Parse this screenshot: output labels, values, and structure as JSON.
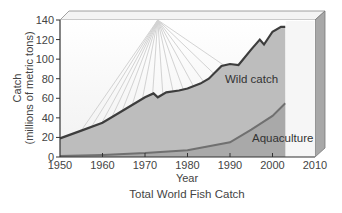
{
  "chart_data": {
    "type": "area",
    "title": "Total World Fish Catch",
    "xlabel": "Year",
    "ylabel": "Catch",
    "ylabel_sub": "(millions of metric tons)",
    "xlim": [
      1950,
      2010
    ],
    "ylim": [
      0,
      140
    ],
    "x_ticks": [
      1950,
      1960,
      1970,
      1980,
      1990,
      2000,
      2010
    ],
    "y_ticks": [
      0,
      20,
      40,
      60,
      80,
      100,
      120,
      140
    ],
    "grid": false,
    "legend": "inline labels",
    "series": [
      {
        "name": "Wild catch",
        "color": "#3d3d3d",
        "fill": "#bdbdbd",
        "x": [
          1950,
          1955,
          1960,
          1965,
          1970,
          1972,
          1973,
          1975,
          1978,
          1980,
          1983,
          1985,
          1988,
          1990,
          1992,
          1995,
          1997,
          1998,
          2000,
          2002,
          2003
        ],
        "values": [
          19,
          27,
          35,
          48,
          61,
          65,
          61,
          66,
          68,
          70,
          75,
          80,
          93,
          95,
          94,
          110,
          120,
          115,
          128,
          133,
          133
        ]
      },
      {
        "name": "Aquaculture",
        "color": "#707070",
        "fill": "#a9a9a9",
        "x": [
          1950,
          1960,
          1970,
          1980,
          1985,
          1990,
          1995,
          2000,
          2003
        ],
        "values": [
          1,
          2,
          4,
          7,
          11,
          15,
          28,
          42,
          55
        ]
      }
    ]
  },
  "labels": {
    "title": "Total World Fish Catch",
    "xlabel": "Year",
    "ylabel": "Catch",
    "ylabel_sub": "(millions of metric tons)",
    "wild": "Wild catch",
    "aqua": "Aquaculture"
  }
}
